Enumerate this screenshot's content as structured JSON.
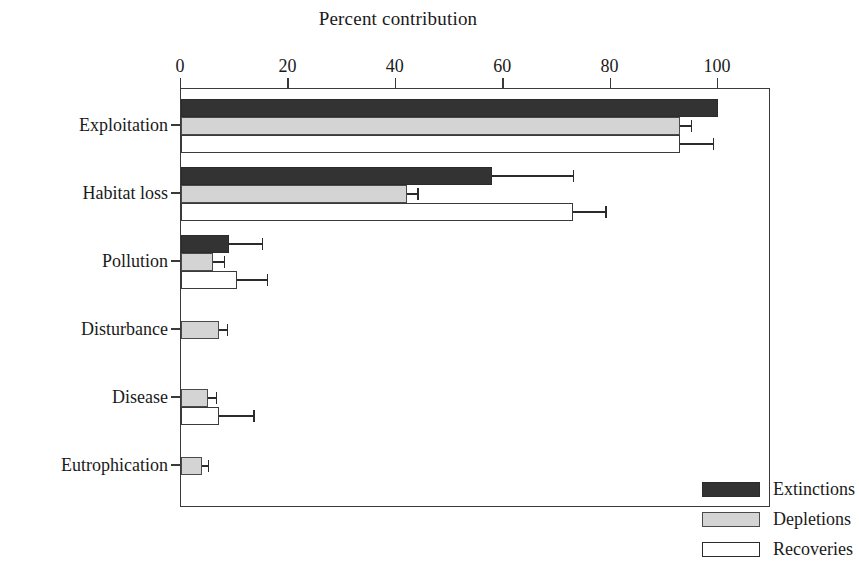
{
  "chart_data": {
    "type": "bar",
    "orientation": "horizontal",
    "title": "Percent contribution",
    "xlabel": "Percent contribution",
    "ylabel": "",
    "xlim": [
      0,
      110
    ],
    "xticks": [
      0,
      20,
      40,
      60,
      80,
      100
    ],
    "xtick_labels": [
      "0",
      "20",
      "40",
      "60",
      "80",
      "100"
    ],
    "grid": false,
    "legend_position": "lower right",
    "categories": [
      "Exploitation",
      "Habitat loss",
      "Pollution",
      "Disturbance",
      "Disease",
      "Eutrophication"
    ],
    "series": [
      {
        "name": "Extinctions",
        "color": "#333333",
        "values": [
          100,
          58,
          9,
          0,
          0,
          0
        ],
        "errors": [
          0,
          15,
          6,
          0,
          0,
          0
        ]
      },
      {
        "name": "Depletions",
        "color": "#d4d4d4",
        "values": [
          93,
          42,
          6,
          7,
          5,
          4
        ],
        "errors": [
          2,
          2,
          2,
          1.5,
          1.5,
          1
        ]
      },
      {
        "name": "Recoveries",
        "color": "#ffffff",
        "values": [
          93,
          73,
          10.5,
          0,
          7,
          0
        ],
        "errors": [
          6,
          6,
          5.5,
          0,
          6.5,
          0
        ]
      }
    ]
  },
  "legend": {
    "items": [
      {
        "label": "Extinctions",
        "swatch": "extinctions"
      },
      {
        "label": "Depletions",
        "swatch": "depletions"
      },
      {
        "label": "Recoveries",
        "swatch": "recoveries"
      }
    ]
  }
}
